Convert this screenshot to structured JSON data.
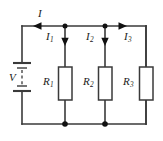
{
  "figure": {
    "name": "parallel-resistor-circuit",
    "type": "schematic",
    "width": 163,
    "height": 141,
    "background_color": "#ffffff",
    "wire_color": "#3a3a3a",
    "node_color": "#111111",
    "label_color": "#1a1a1a"
  },
  "source": {
    "symbol": "battery-multicell",
    "label": "V",
    "label_full": "V"
  },
  "currents": [
    {
      "label": "I",
      "sub": "",
      "arrow": "right",
      "on": "top-wire-left-segment"
    },
    {
      "label": "I",
      "sub": "1",
      "arrow": "down",
      "on": "branch-1-vertical"
    },
    {
      "label": "I",
      "sub": "2",
      "arrow": "down",
      "on": "branch-2-vertical"
    },
    {
      "label": "I",
      "sub": "3",
      "arrow": "right",
      "on": "top-wire-right-segment"
    }
  ],
  "resistors": [
    {
      "label": "R",
      "sub": "1",
      "symbol": "box",
      "branch": 1
    },
    {
      "label": "R",
      "sub": "2",
      "symbol": "box",
      "branch": 2
    },
    {
      "label": "R",
      "sub": "3",
      "symbol": "box",
      "branch": 3
    }
  ],
  "nodes": [
    {
      "name": "top-node-1",
      "x": 65,
      "y": 26
    },
    {
      "name": "top-node-2",
      "x": 105,
      "y": 26
    },
    {
      "name": "bottom-node-1",
      "x": 65,
      "y": 124
    },
    {
      "name": "bottom-node-2",
      "x": 105,
      "y": 124
    }
  ]
}
